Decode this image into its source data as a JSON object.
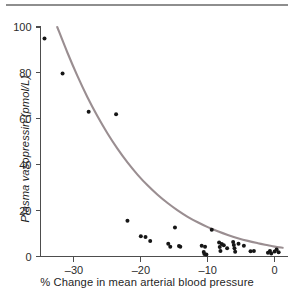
{
  "figure": {
    "has_top_rule": true,
    "background_color": "#ffffff"
  },
  "chart_data": {
    "type": "scatter",
    "title": "",
    "subtitle": "",
    "xlabel": "% Change in mean arterial blood pressure",
    "ylabel": "Plasma vasopressin (pmol/L)",
    "xlim": [
      -35,
      2
    ],
    "ylim": [
      0,
      100
    ],
    "xticks": [
      -30,
      -20,
      -10,
      0
    ],
    "xticklabels": [
      "–30",
      "–20",
      "–10",
      "0"
    ],
    "yticks": [
      0,
      20,
      40,
      60,
      80,
      100
    ],
    "yticklabels": [
      "0",
      "20",
      "40",
      "60",
      "80",
      "100"
    ],
    "grid": false,
    "legend": null,
    "marker_color": "#161616",
    "marker_size_px": 3.0,
    "curve_color": "#9a8e91",
    "curve_label": "exponential fit",
    "points": [
      [
        -34.4,
        95.0
      ],
      [
        -31.7,
        79.7
      ],
      [
        -27.8,
        63.1
      ],
      [
        -23.7,
        62.0
      ],
      [
        -22.0,
        15.6
      ],
      [
        -20.0,
        8.8
      ],
      [
        -19.3,
        8.5
      ],
      [
        -18.6,
        6.7
      ],
      [
        -15.9,
        5.6
      ],
      [
        -15.6,
        4.3
      ],
      [
        -14.9,
        12.6
      ],
      [
        -14.3,
        4.6
      ],
      [
        -14.1,
        4.3
      ],
      [
        -10.9,
        4.7
      ],
      [
        -10.6,
        2.0
      ],
      [
        -10.5,
        1.1
      ],
      [
        -10.4,
        4.2
      ],
      [
        -10.2,
        0.9
      ],
      [
        -9.4,
        11.7
      ],
      [
        -8.3,
        6.1
      ],
      [
        -8.2,
        4.1
      ],
      [
        -8.1,
        2.4
      ],
      [
        -7.9,
        5.4
      ],
      [
        -7.6,
        4.9
      ],
      [
        -7.1,
        3.6
      ],
      [
        -6.2,
        6.3
      ],
      [
        -6.1,
        5.0
      ],
      [
        -6.0,
        3.6
      ],
      [
        -5.9,
        2.1
      ],
      [
        -5.4,
        5.6
      ],
      [
        -4.6,
        4.7
      ],
      [
        -3.6,
        2.3
      ],
      [
        -3.1,
        2.4
      ],
      [
        -1.0,
        1.6
      ],
      [
        -0.7,
        2.4
      ],
      [
        -0.5,
        1.3
      ],
      [
        0.0,
        2.2
      ],
      [
        0.3,
        3.1
      ],
      [
        0.6,
        1.8
      ]
    ],
    "curve": {
      "model": "exponential-decay",
      "description": "Plasma vasopressin decreases exponentially as percent change in mean arterial blood pressure rises toward zero",
      "x_start": -32.5,
      "x_end": 1.2,
      "y_start": 100.0,
      "y_end": 2.4,
      "samples": [
        [
          -32.5,
          100.0
        ],
        [
          -31.0,
          89.0
        ],
        [
          -29.5,
          78.8
        ],
        [
          -28.0,
          69.5
        ],
        [
          -26.5,
          61.2
        ],
        [
          -25.0,
          53.7
        ],
        [
          -23.5,
          47.0
        ],
        [
          -22.0,
          41.0
        ],
        [
          -20.5,
          35.7
        ],
        [
          -19.0,
          31.0
        ],
        [
          -17.5,
          26.9
        ],
        [
          -16.0,
          23.3
        ],
        [
          -14.5,
          20.1
        ],
        [
          -13.0,
          17.3
        ],
        [
          -11.5,
          14.9
        ],
        [
          -10.0,
          12.8
        ],
        [
          -8.5,
          11.0
        ],
        [
          -7.0,
          9.4
        ],
        [
          -5.5,
          8.0
        ],
        [
          -4.0,
          6.8
        ],
        [
          -2.5,
          5.8
        ],
        [
          -1.0,
          4.9
        ],
        [
          0.0,
          4.3
        ],
        [
          1.2,
          3.8
        ]
      ]
    }
  }
}
